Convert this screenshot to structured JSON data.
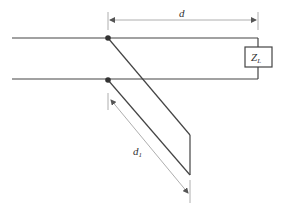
{
  "diagram": {
    "type": "transmission-line-stub",
    "labels": {
      "d": "d",
      "d1_main": "d",
      "d1_sub": "1",
      "load_main": "Z",
      "load_sub": "L"
    },
    "colors": {
      "line": "#444444",
      "dimension": "#999999",
      "node": "#333333"
    }
  }
}
